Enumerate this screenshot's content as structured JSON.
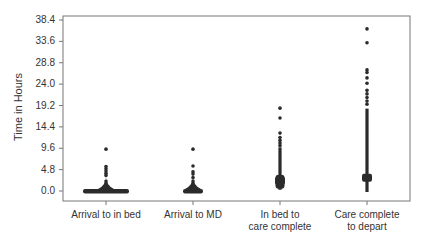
{
  "chart_data": {
    "type": "scatter",
    "subtype": "strip/dot plot of durations",
    "title": "",
    "xlabel": "",
    "ylabel": "Time in Hours",
    "ylim": [
      0,
      38.4
    ],
    "yticks": [
      0.0,
      4.8,
      9.6,
      14.4,
      19.2,
      24.0,
      28.8,
      33.6,
      38.4
    ],
    "ytick_labels": [
      "0.0",
      "4.8",
      "9.6",
      "14.4",
      "19.2",
      "24.0",
      "28.8",
      "33.6",
      "38.4"
    ],
    "categories": [
      "Arrival to in bed",
      "Arrival to MD",
      "In bed to\ncare complete",
      "Care complete\nto depart"
    ],
    "grid": false,
    "legend": null,
    "series": [
      {
        "name": "Arrival to in bed",
        "dense_range": [
          0.0,
          2.5
        ],
        "median_cluster": 0.1,
        "outliers": [
          3.5,
          4.0,
          4.5,
          5.0,
          5.5,
          9.4
        ]
      },
      {
        "name": "Arrival to MD",
        "dense_range": [
          0.0,
          2.5
        ],
        "median_cluster": 0.3,
        "outliers": [
          3.0,
          3.8,
          4.3,
          5.6,
          9.4
        ]
      },
      {
        "name": "In bed to care complete",
        "dense_range": [
          0.5,
          9.8
        ],
        "median_cluster": 2.3,
        "outliers": [
          10.2,
          10.8,
          11.4,
          12.0,
          13.0,
          16.4,
          18.6
        ]
      },
      {
        "name": "Care complete to depart",
        "dense_range": [
          0.0,
          18.5
        ],
        "median_cluster": 3.0,
        "outliers": [
          19.5,
          20.2,
          21.0,
          21.8,
          22.6,
          24.2,
          25.4,
          26.6,
          27.2,
          33.3,
          36.4
        ]
      }
    ]
  }
}
